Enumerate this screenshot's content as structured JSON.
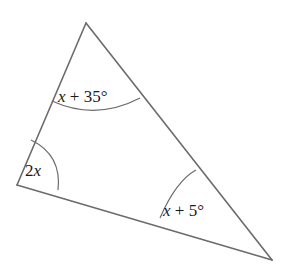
{
  "figure": {
    "kind": "geometry-diagram",
    "shape": "triangle",
    "background_color": "#ffffff",
    "stroke_color": "#6b6b6b",
    "arc_color": "#6b6b6b",
    "text_color": "#1a1a1a",
    "stroke_width": 1.6,
    "arc_width": 1.2,
    "width": 289,
    "height": 273
  },
  "vertices": {
    "apex": {
      "name": "top-vertex",
      "x": 86,
      "y": 23
    },
    "left": {
      "name": "left-vertex",
      "x": 17,
      "y": 185
    },
    "right": {
      "name": "right-vertex",
      "x": 272,
      "y": 260
    }
  },
  "sides": [
    {
      "name": "left-side",
      "from": "apex",
      "to": "left"
    },
    {
      "name": "right-side",
      "from": "apex",
      "to": "right"
    },
    {
      "name": "base-side",
      "from": "left",
      "to": "right"
    }
  ],
  "angles": [
    {
      "id": "apex-angle",
      "vertex": "apex",
      "label_parts": {
        "variable": "x",
        "operator": " + ",
        "constant": "35°"
      },
      "label_text": "x + 35°",
      "label_x": 58,
      "label_y": 102,
      "arc_path": "M 52 101 Q 96 121 140 98"
    },
    {
      "id": "left-angle",
      "vertex": "left",
      "label_parts": {
        "variable": "x",
        "operator": "",
        "constant": "",
        "coefficient": "2"
      },
      "label_text": "2x",
      "label_x": 25,
      "label_y": 176,
      "arc_path": "M 31 140 Q 62 155 58 190"
    },
    {
      "id": "right-angle",
      "vertex": "right",
      "label_parts": {
        "variable": "x",
        "operator": " + ",
        "constant": "5°"
      },
      "label_text": "x + 5°",
      "label_x": 163,
      "label_y": 216,
      "arc_path": "M 160 218 Q 176 181 196 170"
    }
  ]
}
